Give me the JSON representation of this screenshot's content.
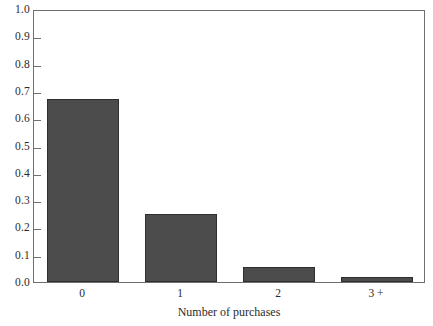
{
  "chart_data": {
    "type": "bar",
    "title": "",
    "xlabel": "Number of purchases",
    "ylabel": "",
    "categories": [
      "0",
      "1",
      "2",
      "3 +"
    ],
    "values": [
      0.67,
      0.25,
      0.055,
      0.02
    ],
    "ylim": [
      0.0,
      1.0
    ],
    "ytick_labels": [
      "1.0",
      "0.9",
      "0.8",
      "0.7",
      "0.6",
      "0.5",
      "0.4",
      "0.3",
      "0.2",
      "0.1",
      "0.0"
    ],
    "ytick_values": [
      1.0,
      0.9,
      0.8,
      0.7,
      0.6,
      0.5,
      0.4,
      0.3,
      0.2,
      0.1,
      0.0
    ],
    "grid": false,
    "legend": false,
    "legend_position": "none",
    "bar_color": "#4c4c4c",
    "bar_edge_color": "#2e2e2e",
    "frame_color": "#6f6f70",
    "background_color": "#ffffff",
    "text_color": "#2b2b2b"
  }
}
